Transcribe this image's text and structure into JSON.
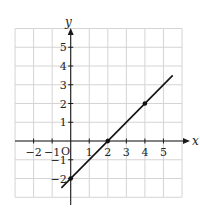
{
  "chart_data": {
    "type": "line",
    "title": "",
    "xlabel": "x",
    "ylabel": "y",
    "xlim": [
      -3,
      6
    ],
    "ylim": [
      -3,
      6
    ],
    "grid": true,
    "x_ticks": [
      -2,
      -1,
      1,
      2,
      3,
      4,
      5
    ],
    "x_tick_labels": [
      "−2",
      "−1",
      "1",
      "2",
      "3",
      "4",
      "5"
    ],
    "y_ticks": [
      5,
      4,
      3,
      2,
      1,
      -1,
      -2
    ],
    "y_tick_labels": [
      "5",
      "4",
      "3",
      "2",
      "1",
      "−1",
      "−2"
    ],
    "origin_label": "O",
    "series": [
      {
        "name": "y = x − 2",
        "line_from": [
          -0.5,
          -2.5
        ],
        "line_to": [
          5.5,
          3.5
        ],
        "marked_points": [
          [
            0,
            -2
          ],
          [
            2,
            0
          ],
          [
            4,
            2
          ]
        ]
      }
    ]
  }
}
